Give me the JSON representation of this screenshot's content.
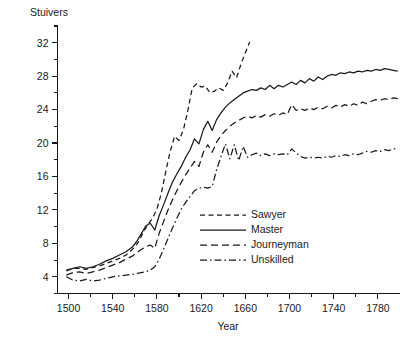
{
  "chart_data": {
    "type": "line",
    "title": "",
    "ylabel": "Stuivers",
    "xlabel": "Year",
    "xlim": [
      1490,
      1800
    ],
    "ylim": [
      2,
      34
    ],
    "grid": false,
    "legend_position": "inside-center-bottom",
    "x_ticks_major": [
      1500,
      1540,
      1580,
      1620,
      1660,
      1700,
      1740,
      1780
    ],
    "x_ticks_minor": [
      1520,
      1560,
      1600,
      1640,
      1680,
      1720,
      1760
    ],
    "y_ticks_major": [
      4,
      8,
      12,
      16,
      20,
      24,
      28,
      32
    ],
    "y_ticks_minor": [
      2,
      6,
      10,
      14,
      18,
      22,
      26,
      30,
      34
    ],
    "series": [
      {
        "name": "Sawyer",
        "dash": "short-dash",
        "dasharray": "5,3.5",
        "x": [
          1498,
          1504,
          1510,
          1516,
          1522,
          1528,
          1534,
          1540,
          1546,
          1552,
          1558,
          1563,
          1568,
          1572,
          1576,
          1580,
          1584,
          1588,
          1592,
          1596,
          1600,
          1604,
          1608,
          1612,
          1616,
          1620,
          1624,
          1628,
          1632,
          1636,
          1640,
          1644,
          1648,
          1652,
          1656,
          1660,
          1664
        ],
        "y": [
          4.8,
          5.0,
          5.0,
          4.9,
          5.1,
          5.3,
          5.6,
          5.9,
          6.2,
          6.6,
          7.3,
          8.1,
          9.4,
          10.3,
          11.0,
          12.1,
          14.0,
          16.6,
          19.0,
          20.8,
          20.3,
          21.6,
          23.9,
          26.6,
          27.1,
          26.7,
          26.8,
          26.0,
          26.2,
          26.6,
          26.3,
          27.2,
          28.6,
          27.8,
          29.4,
          30.8,
          32.1
        ]
      },
      {
        "name": "Master",
        "dash": "solid",
        "dasharray": "none",
        "x": [
          1498,
          1504,
          1510,
          1516,
          1522,
          1528,
          1534,
          1540,
          1546,
          1552,
          1558,
          1562,
          1566,
          1570,
          1574,
          1578,
          1582,
          1586,
          1590,
          1594,
          1598,
          1602,
          1606,
          1610,
          1614,
          1618,
          1622,
          1626,
          1630,
          1634,
          1638,
          1642,
          1646,
          1650,
          1654,
          1658,
          1662,
          1666,
          1670,
          1674,
          1678,
          1682,
          1686,
          1690,
          1694,
          1698,
          1702,
          1706,
          1710,
          1714,
          1718,
          1722,
          1726,
          1730,
          1734,
          1738,
          1742,
          1746,
          1750,
          1754,
          1758,
          1762,
          1766,
          1770,
          1774,
          1778,
          1782,
          1786,
          1790,
          1794,
          1798
        ],
        "y": [
          4.7,
          5.0,
          5.2,
          5.0,
          5.2,
          5.5,
          5.9,
          6.2,
          6.6,
          7.0,
          7.6,
          8.3,
          9.2,
          10.1,
          10.4,
          9.6,
          11.3,
          12.6,
          14.0,
          15.3,
          16.3,
          17.2,
          18.3,
          19.2,
          20.5,
          19.9,
          21.6,
          22.6,
          21.5,
          22.8,
          23.6,
          24.3,
          24.8,
          25.2,
          25.6,
          26.0,
          26.2,
          26.4,
          26.3,
          26.6,
          26.4,
          26.9,
          26.5,
          26.9,
          26.7,
          27.0,
          27.3,
          27.0,
          27.5,
          27.2,
          27.7,
          27.4,
          27.9,
          27.6,
          28.0,
          28.2,
          28.1,
          28.4,
          28.3,
          28.5,
          28.4,
          28.6,
          28.5,
          28.7,
          28.6,
          28.8,
          28.7,
          28.9,
          28.8,
          28.7,
          28.6
        ]
      },
      {
        "name": "Journeyman",
        "dash": "long-dash",
        "dasharray": "7,4",
        "x": [
          1498,
          1504,
          1510,
          1516,
          1522,
          1528,
          1534,
          1540,
          1546,
          1552,
          1558,
          1562,
          1566,
          1570,
          1574,
          1578,
          1582,
          1586,
          1590,
          1594,
          1598,
          1602,
          1606,
          1610,
          1614,
          1618,
          1622,
          1626,
          1630,
          1634,
          1638,
          1642,
          1646,
          1650,
          1654,
          1658,
          1662,
          1666,
          1670,
          1674,
          1678,
          1682,
          1686,
          1690,
          1694,
          1698,
          1702,
          1706,
          1710,
          1714,
          1718,
          1722,
          1726,
          1730,
          1734,
          1738,
          1742,
          1746,
          1750,
          1754,
          1758,
          1762,
          1766,
          1770,
          1774,
          1778,
          1782,
          1786,
          1790,
          1794,
          1798
        ],
        "y": [
          4.2,
          4.5,
          4.6,
          4.4,
          4.6,
          4.8,
          5.1,
          5.4,
          5.7,
          6.1,
          6.5,
          6.9,
          7.3,
          7.6,
          7.8,
          7.4,
          9.2,
          10.6,
          12.0,
          13.2,
          14.3,
          15.3,
          16.2,
          17.0,
          17.8,
          17.2,
          18.9,
          19.8,
          18.9,
          20.1,
          20.9,
          21.5,
          22.0,
          22.4,
          22.7,
          23.0,
          23.2,
          23.0,
          23.3,
          23.1,
          23.4,
          23.2,
          23.5,
          23.3,
          23.6,
          23.4,
          24.6,
          23.9,
          24.1,
          23.9,
          24.2,
          24.0,
          24.3,
          24.1,
          24.4,
          24.2,
          24.5,
          24.3,
          24.6,
          24.4,
          24.7,
          24.5,
          24.9,
          24.7,
          25.0,
          25.2,
          25.1,
          25.3,
          25.2,
          25.4,
          25.3
        ]
      },
      {
        "name": "Unskilled",
        "dash": "dash-dot",
        "dasharray": "7,3,1.5,3",
        "x": [
          1498,
          1504,
          1510,
          1516,
          1522,
          1528,
          1534,
          1540,
          1546,
          1552,
          1558,
          1562,
          1566,
          1570,
          1574,
          1578,
          1582,
          1586,
          1590,
          1594,
          1598,
          1602,
          1606,
          1610,
          1614,
          1618,
          1622,
          1626,
          1630,
          1634,
          1638,
          1642,
          1646,
          1650,
          1654,
          1658,
          1662,
          1666,
          1670,
          1674,
          1678,
          1682,
          1686,
          1690,
          1694,
          1698,
          1702,
          1706,
          1710,
          1714,
          1718,
          1722,
          1726,
          1730,
          1734,
          1738,
          1742,
          1746,
          1750,
          1754,
          1758,
          1762,
          1766,
          1770,
          1774,
          1778,
          1782,
          1786,
          1790,
          1794,
          1798
        ],
        "y": [
          4.0,
          3.6,
          3.5,
          3.7,
          3.5,
          3.6,
          3.8,
          4.0,
          4.1,
          4.2,
          4.3,
          4.4,
          4.5,
          4.6,
          4.8,
          5.2,
          6.1,
          7.3,
          8.6,
          9.8,
          11.0,
          12.1,
          12.9,
          13.6,
          14.3,
          14.6,
          14.7,
          14.6,
          14.8,
          16.8,
          18.4,
          19.9,
          18.1,
          19.8,
          17.9,
          19.6,
          18.3,
          18.6,
          18.8,
          18.5,
          18.7,
          18.5,
          18.7,
          18.6,
          18.7,
          18.6,
          19.3,
          18.8,
          18.4,
          18.2,
          18.3,
          18.2,
          18.3,
          18.2,
          18.4,
          18.3,
          18.5,
          18.4,
          18.6,
          18.5,
          18.7,
          18.6,
          18.8,
          19.0,
          18.9,
          19.1,
          19.0,
          19.2,
          19.1,
          19.3,
          19.4
        ]
      }
    ]
  },
  "legend": {
    "items": [
      {
        "label": "Sawyer",
        "dasharray": "5,3.5"
      },
      {
        "label": "Master",
        "dasharray": "none"
      },
      {
        "label": "Journeyman",
        "dasharray": "7,4"
      },
      {
        "label": "Unskilled",
        "dasharray": "7,3,1.5,3"
      }
    ]
  },
  "style": {
    "ink": "#1a1a1a",
    "background": "#ffffff"
  }
}
